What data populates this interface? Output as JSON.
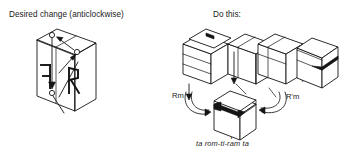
{
  "figure": {
    "left_panel": {
      "title": "Desired change (anticlockwise)",
      "cube_faces": [
        "F",
        "R"
      ],
      "rotation_sense": "anticlockwise"
    },
    "right_panel": {
      "title": "Do this:",
      "steps": [
        {
          "label": "T'",
          "position": "top-row-1"
        },
        {
          "label": "",
          "position": "top-row-2"
        },
        {
          "label": "",
          "position": "top-row-3"
        },
        {
          "label": "T'",
          "position": "top-row-4"
        },
        {
          "label": "T2",
          "position": "center-bottom"
        }
      ],
      "move_labels": {
        "left": "Rm",
        "right": "R'm",
        "first_cube": "T'",
        "last_cube": "T'",
        "bottom_cube": "T"
      },
      "bottom_cube_exponent": "2",
      "mnemonic": "ta  rom-ti-ram  ta"
    },
    "colors": {
      "ink": "#141414",
      "background": "#ffffff"
    }
  }
}
